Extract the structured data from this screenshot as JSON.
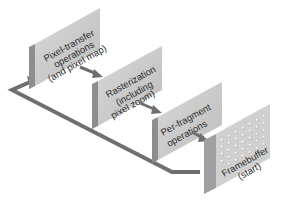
{
  "diagram": {
    "nodes": [
      {
        "id": "pixel-transfer",
        "lines": [
          "Pixel-transfer",
          "operations",
          "(and pixel map)"
        ]
      },
      {
        "id": "rasterization",
        "lines": [
          "Rasterization",
          "(including",
          "pixel zoom)"
        ]
      },
      {
        "id": "per-fragment",
        "lines": [
          "Per-fragment",
          "operations"
        ]
      },
      {
        "id": "framebuffer",
        "lines": [
          "Framebuffer",
          "(start)"
        ]
      }
    ],
    "edges": [
      {
        "from": "framebuffer",
        "to": "pixel-transfer",
        "style": "return loop along the base"
      },
      {
        "from": "pixel-transfer",
        "to": "rasterization"
      },
      {
        "from": "rasterization",
        "to": "per-fragment"
      },
      {
        "from": "per-fragment",
        "to": "framebuffer"
      }
    ],
    "colors": {
      "box_front": "#c9c9c9",
      "box_side": "#8e8e8e",
      "box_top": "#e2e2e2",
      "arrow": "#6f6f6f",
      "text": "#2b2b2b"
    }
  }
}
